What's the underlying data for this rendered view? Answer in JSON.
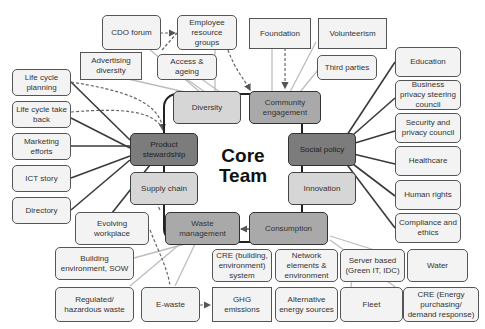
{
  "diagram": {
    "center": {
      "title_line1": "Core",
      "title_line2": "Team"
    },
    "core_areas": [
      {
        "id": "diversity",
        "label": "Diversity",
        "shade": "light"
      },
      {
        "id": "community",
        "label": "Community engagement",
        "shade": "mid"
      },
      {
        "id": "social",
        "label": "Social policy",
        "shade": "dark"
      },
      {
        "id": "innovation",
        "label": "Innovation",
        "shade": "light"
      },
      {
        "id": "consumption",
        "label": "Consumption",
        "shade": "mid"
      },
      {
        "id": "waste",
        "label": "Waste management",
        "shade": "mid"
      },
      {
        "id": "supply",
        "label": "Supply chain",
        "shade": "light"
      },
      {
        "id": "product",
        "label": "Product stewardship",
        "shade": "dark"
      }
    ],
    "satellites": {
      "cdo_forum": "CDO forum",
      "employee_groups": "Employee resource groups",
      "advertising_diversity": "Advertising diversity",
      "access_ageing": "Access & ageing",
      "foundation": "Foundation",
      "volunteerism": "Volunteerism",
      "third_parties": "Third parties",
      "education": "Education",
      "business_privacy": "Business privacy steering council",
      "security_privacy": "Security and privacy council",
      "healthcare": "Healthcare",
      "human_rights": "Human rights",
      "compliance": "Compliance and ethics",
      "life_cycle_planning": "Life cycle planning",
      "life_cycle_take_back": "Life cycle take back",
      "marketing": "Marketing efforts",
      "ict_story": "ICT story",
      "directory": "Directory",
      "evolving_workplace": "Evolving workplace",
      "building_env": "Building environment, SOW",
      "regulated_waste": "Regulated/ hazardous waste",
      "ewaste": "E-waste",
      "ghg": "GHG emissions",
      "cre_building": "CRE (building, environment) system",
      "network_elements": "Network elements & environment",
      "alternative_energy": "Alternative energy sources",
      "server_based": "Server based (Green IT, IDC)",
      "fleet": "Fleet",
      "water": "Water",
      "cre_energy": "CRE (Energy purchasing/ demand response)"
    }
  }
}
